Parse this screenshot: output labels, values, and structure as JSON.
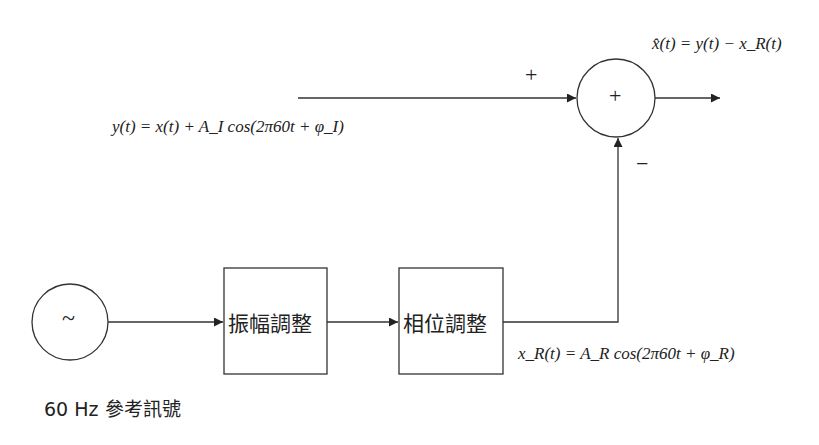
{
  "diagram": {
    "type": "block-diagram",
    "nodes": [
      {
        "id": "reference-oscillator",
        "symbol": "~",
        "label": "60 Hz 參考訊號"
      },
      {
        "id": "amplitude-adjust",
        "label": "振幅調整"
      },
      {
        "id": "phase-adjust",
        "label": "相位調整"
      },
      {
        "id": "summer",
        "symbol": "+"
      }
    ],
    "edges": [
      {
        "from": "reference-oscillator",
        "to": "amplitude-adjust"
      },
      {
        "from": "amplitude-adjust",
        "to": "phase-adjust"
      },
      {
        "from": "phase-adjust",
        "to": "summer",
        "sign": "−",
        "signal": "x_R(t) = A_R cos(2π60t + φ_R)"
      },
      {
        "from": "input",
        "to": "summer",
        "sign": "+",
        "signal": "y(t) = x(t) + A_I cos(2π60t + φ_I)"
      },
      {
        "from": "summer",
        "to": "output",
        "signal": "x̂(t) = y(t) − x_R(t)"
      }
    ]
  },
  "labels": {
    "output_eq": "x̂(t) = y(t) − x_R(t)",
    "input_eq": "y(t) = x(t) + A_I cos(2π60t + φ_I)",
    "reference_eq": "x_R(t) = A_R cos(2π60t + φ_R)",
    "plus_sign_input": "+",
    "minus_sign_feedback": "−",
    "summer_symbol": "+",
    "oscillator_symbol": "~",
    "oscillator_caption": "60 Hz 參考訊號",
    "amplitude_box": "振幅調整",
    "phase_box": "相位調整"
  }
}
